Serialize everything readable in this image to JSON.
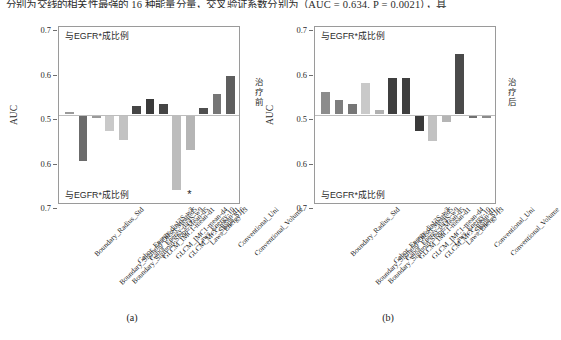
{
  "page": {
    "top_cutoff_text": "分别为交线的相关性最强的 16 种能量分量，交叉验证系数分别为（AUC = 0.634, P = 0.0021），具"
  },
  "panels": [
    {
      "id": "a",
      "caption": "(a)",
      "side_vertical_label": "治疗前",
      "y_axis_title": "AUC",
      "y_ticks": [
        "0.7",
        "0.6",
        "0.5",
        "0.6",
        "0.7"
      ],
      "annotation_top": "与EGFR*成比例",
      "annotation_bottom": "与EGFR*成比例",
      "significance_marker": "*",
      "significance_marker_index": 9
    },
    {
      "id": "b",
      "caption": "(b)",
      "side_vertical_label": "治疗后",
      "y_axis_title": "AUC",
      "y_ticks": [
        "0.7",
        "0.6",
        "0.5",
        "0.6",
        "0.7"
      ],
      "annotation_top": "与EGFR*成比例",
      "annotation_bottom": "与EGFR*成比例",
      "significance_marker": "",
      "significance_marker_index": -1
    }
  ],
  "chart_data": [
    {
      "type": "bar",
      "title": "(a)",
      "xlabel": "",
      "ylabel": "AUC",
      "ylim": [
        0.7,
        0.7
      ],
      "axis_note": "Diverging axis: centre 0.5, mirrored 0.6 and 0.7 above and below",
      "grid": false,
      "legend": "none",
      "categories": [
        "Boundary_Radius_Std",
        "Boundary_Sigmoid-Offset-Mean-d5",
        "Boundary_Sigmoid-Slope-Mean-d5",
        "Gabor_Energy-dir13S-w3",
        "Gabor_Energy-dir4S-w9",
        "GLCM_IMC1-mean-d1",
        "GLCM_IMC1-mean-d4",
        "GLCM_MCC-mean-d1",
        "Laws_Energy-10",
        "Laws_Energy-13",
        "Shape_S16",
        "Conventional_Uni",
        "Conventional_Volume"
      ],
      "values": [
        0.503,
        0.601,
        0.504,
        0.533,
        0.555,
        0.519,
        0.533,
        0.522,
        0.666,
        0.577,
        0.513,
        0.545,
        0.585
      ],
      "signed_direction": [
        "up",
        "down",
        "down",
        "down",
        "down",
        "up",
        "up",
        "up",
        "down",
        "down",
        "up",
        "up",
        "up"
      ],
      "bar_colors": [
        "#9a9a9a",
        "#6b6b6b",
        "#9a9a9a",
        "#c9c9c9",
        "#c2c2c2",
        "#454545",
        "#3a3a3a",
        "#454545",
        "#bdbdbd",
        "#b5b5b5",
        "#4f4f4f",
        "#767676",
        "#5e5e5e"
      ]
    },
    {
      "type": "bar",
      "title": "(b)",
      "xlabel": "",
      "ylabel": "AUC",
      "ylim": [
        0.7,
        0.7
      ],
      "axis_note": "Diverging axis: centre 0.5, mirrored 0.6 and 0.7 above and below",
      "grid": false,
      "legend": "none",
      "categories": [
        "Boundary_Radius_Std",
        "Boundary_Sigmoid-Offset-Mean-d5",
        "Boundary_Sigmoid-Slope-Mean-d5",
        "Gabor_Energy-dir13S-w3",
        "Gabor_Energy-dir4S-w9",
        "GLCM_IMC1-mean-d1",
        "GLCM_IMC1-mean-d4",
        "GLCM_MCC-mean-d1",
        "Laws_Energy-10",
        "Laws_Energy-13",
        "Shape_S16",
        "Conventional_Uni",
        "Conventional_Volume"
      ],
      "values": [
        0.549,
        0.532,
        0.522,
        0.57,
        0.508,
        0.582,
        0.582,
        0.534,
        0.556,
        0.513,
        0.634,
        0.503,
        0.505
      ],
      "signed_direction": [
        "up",
        "up",
        "up",
        "up",
        "up",
        "up",
        "up",
        "down",
        "down",
        "down",
        "up",
        "down",
        "down"
      ],
      "bar_colors": [
        "#8c8c8c",
        "#7e7e7e",
        "#767676",
        "#c9c9c9",
        "#b0b0b0",
        "#3f3f3f",
        "#3f3f3f",
        "#3a3a3a",
        "#c2c2c2",
        "#b5b5b5",
        "#4a4a4a",
        "#707070",
        "#8a8a8a"
      ]
    }
  ]
}
